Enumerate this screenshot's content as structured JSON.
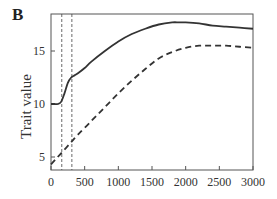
{
  "panel_label": "B",
  "chart_data": {
    "type": "line",
    "title": "",
    "xlabel": "",
    "ylabel": "Trait value",
    "xlim": [
      0,
      3000
    ],
    "ylim": [
      3.7,
      18.5
    ],
    "x_ticks": [
      0,
      500,
      1000,
      1500,
      2000,
      2500,
      3000
    ],
    "y_ticks": [
      5,
      10,
      15
    ],
    "grid": false,
    "legend": null,
    "vertical_reference_lines": [
      {
        "x": 160,
        "style": "dashed"
      },
      {
        "x": 310,
        "style": "dashed"
      }
    ],
    "series": [
      {
        "name": "solid",
        "style": "solid",
        "x": [
          0,
          50,
          100,
          150,
          200,
          250,
          300,
          350,
          400,
          500,
          600,
          800,
          1000,
          1200,
          1400,
          1600,
          1800,
          1900,
          2000,
          2200,
          2400,
          2600,
          2800,
          3000
        ],
        "values": [
          10.0,
          10.0,
          10.0,
          10.2,
          11.0,
          12.0,
          12.5,
          12.7,
          12.9,
          13.4,
          14.0,
          15.0,
          15.9,
          16.6,
          17.1,
          17.5,
          17.7,
          17.7,
          17.7,
          17.6,
          17.4,
          17.3,
          17.2,
          17.1
        ]
      },
      {
        "name": "dashed",
        "style": "dashed",
        "x": [
          0,
          100,
          200,
          300,
          400,
          600,
          800,
          1000,
          1200,
          1400,
          1600,
          1800,
          2000,
          2200,
          2400,
          2600,
          2800,
          3000
        ],
        "values": [
          4.3,
          5.0,
          5.7,
          6.4,
          7.1,
          8.4,
          9.7,
          11.0,
          12.2,
          13.3,
          14.3,
          14.9,
          15.3,
          15.5,
          15.5,
          15.5,
          15.4,
          15.3
        ]
      }
    ]
  }
}
